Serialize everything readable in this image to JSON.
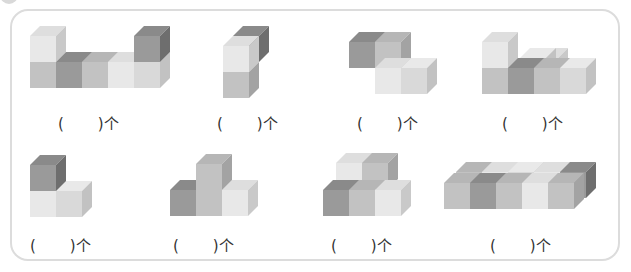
{
  "exercise": {
    "instruction_visible": false,
    "unit": "个",
    "paren_open": "(",
    "paren_close": ")"
  },
  "colors": {
    "light": [
      "#e8e8e8",
      "#dedede",
      "#c9c9c9"
    ],
    "mid": [
      "#c2c2c2",
      "#b6b6b6",
      "#a3a3a3"
    ],
    "dark": [
      "#9a9a9a",
      "#8a8a8a",
      "#6e6e6e"
    ],
    "pale": [
      "#d9d9d9",
      "#e9e9e9",
      "#c2c2c2"
    ]
  },
  "figures": [
    {
      "id": 1,
      "answer_x": 58,
      "answer_y": 112,
      "cubes": [
        {
          "x": 30,
          "y": 62,
          "shade": "mid"
        },
        {
          "x": 56,
          "y": 62,
          "shade": "dark"
        },
        {
          "x": 82,
          "y": 62,
          "shade": "mid"
        },
        {
          "x": 108,
          "y": 62,
          "shade": "light"
        },
        {
          "x": 134,
          "y": 62,
          "shade": "pale"
        },
        {
          "x": 30,
          "y": 36,
          "shade": "light"
        },
        {
          "x": 134,
          "y": 36,
          "shade": "dark"
        }
      ]
    },
    {
      "id": 2,
      "answer_x": 217,
      "answer_y": 112,
      "cubes": [
        {
          "x": 233,
          "y": 36,
          "shade": "dark"
        },
        {
          "x": 223,
          "y": 72,
          "shade": "mid"
        },
        {
          "x": 223,
          "y": 46,
          "shade": "light"
        }
      ]
    },
    {
      "id": 3,
      "answer_x": 357,
      "answer_y": 112,
      "cubes": [
        {
          "x": 349,
          "y": 42,
          "shade": "dark"
        },
        {
          "x": 375,
          "y": 42,
          "shade": "mid"
        },
        {
          "x": 375,
          "y": 68,
          "shade": "light"
        },
        {
          "x": 401,
          "y": 68,
          "shade": "pale"
        }
      ]
    },
    {
      "id": 4,
      "answer_x": 502,
      "answer_y": 112,
      "cubes": [
        {
          "x": 532,
          "y": 58,
          "shade": "light"
        },
        {
          "x": 520,
          "y": 58,
          "shade": "pale"
        },
        {
          "x": 482,
          "y": 68,
          "shade": "mid"
        },
        {
          "x": 482,
          "y": 42,
          "shade": "light"
        },
        {
          "x": 508,
          "y": 68,
          "shade": "dark"
        },
        {
          "x": 534,
          "y": 68,
          "shade": "mid"
        },
        {
          "x": 560,
          "y": 68,
          "shade": "pale"
        }
      ]
    },
    {
      "id": 5,
      "answer_x": 30,
      "answer_y": 234,
      "cubes": [
        {
          "x": 30,
          "y": 191,
          "shade": "light"
        },
        {
          "x": 56,
          "y": 191,
          "shade": "pale"
        },
        {
          "x": 30,
          "y": 165,
          "shade": "dark"
        }
      ]
    },
    {
      "id": 6,
      "answer_x": 173,
      "answer_y": 234,
      "cubes": [
        {
          "x": 170,
          "y": 190,
          "shade": "dark"
        },
        {
          "x": 196,
          "y": 190,
          "shade": "mid"
        },
        {
          "x": 196,
          "y": 164,
          "shade": "mid"
        },
        {
          "x": 222,
          "y": 190,
          "shade": "light"
        }
      ]
    },
    {
      "id": 7,
      "answer_x": 331,
      "answer_y": 234,
      "cubes": [
        {
          "x": 336,
          "y": 163,
          "shade": "light"
        },
        {
          "x": 362,
          "y": 163,
          "shade": "mid"
        },
        {
          "x": 323,
          "y": 190,
          "shade": "dark"
        },
        {
          "x": 349,
          "y": 190,
          "shade": "mid"
        },
        {
          "x": 375,
          "y": 190,
          "shade": "light"
        }
      ]
    },
    {
      "id": 8,
      "answer_x": 490,
      "answer_y": 234,
      "cubes": [
        {
          "x": 456,
          "y": 172,
          "shade": "mid"
        },
        {
          "x": 482,
          "y": 172,
          "shade": "light"
        },
        {
          "x": 508,
          "y": 172,
          "shade": "pale"
        },
        {
          "x": 534,
          "y": 172,
          "shade": "light"
        },
        {
          "x": 560,
          "y": 172,
          "shade": "dark"
        },
        {
          "x": 444,
          "y": 183,
          "shade": "mid"
        },
        {
          "x": 470,
          "y": 183,
          "shade": "dark"
        },
        {
          "x": 496,
          "y": 183,
          "shade": "mid"
        },
        {
          "x": 522,
          "y": 183,
          "shade": "light"
        },
        {
          "x": 548,
          "y": 183,
          "shade": "mid"
        }
      ]
    }
  ]
}
